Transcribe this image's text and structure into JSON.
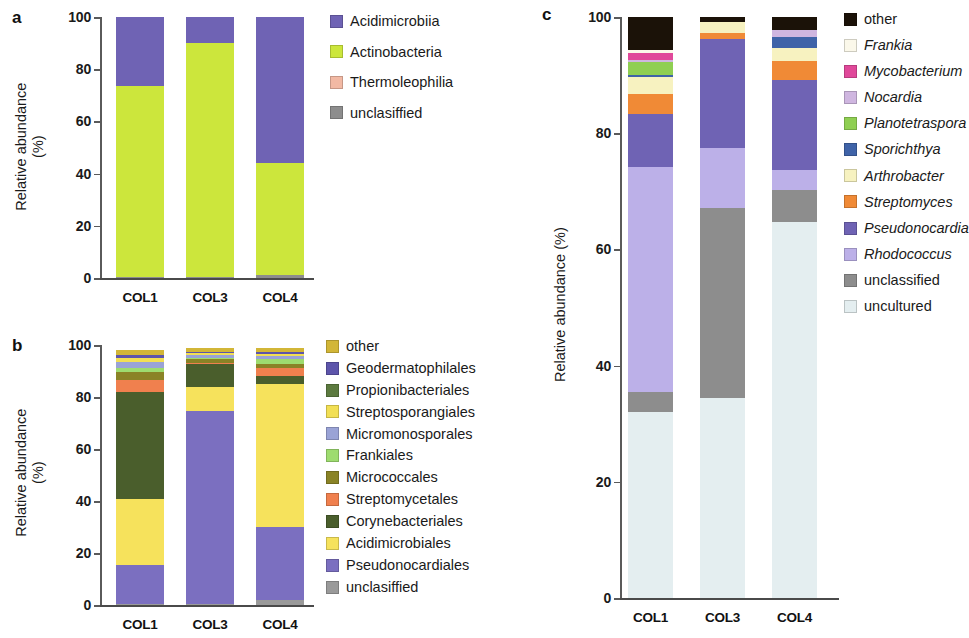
{
  "figure": {
    "panels": [
      "a",
      "b",
      "c"
    ],
    "y_axis_label": "Relative abundance",
    "y_axis_unit": "(%)",
    "y_axis_label_c": "Relative abundance (%)"
  },
  "panel_a": {
    "letter": "a",
    "ylabel_line1": "Relative abundance",
    "ylabel_line2": "(%)",
    "ticks": [
      "100",
      "80",
      "60",
      "40",
      "20",
      "0"
    ],
    "categories": [
      "COL1",
      "COL3",
      "COL4"
    ],
    "legend": [
      {
        "label": "Acidimicrobiia",
        "color": "#6f63b4"
      },
      {
        "label": "Actinobacteria",
        "color": "#cce63c"
      },
      {
        "label": "Thermoleophilia",
        "color": "#f2b9a4"
      },
      {
        "label": "unclasiffied",
        "color": "#8d8d8d"
      }
    ]
  },
  "panel_b": {
    "letter": "b",
    "ylabel_line1": "Relative abundance",
    "ylabel_line2": "(%)",
    "ticks": [
      "100",
      "80",
      "60",
      "40",
      "20",
      "0"
    ],
    "categories": [
      "COL1",
      "COL3",
      "COL4"
    ],
    "legend": [
      {
        "label": "other",
        "color": "#d2b637"
      },
      {
        "label": "Geodermatophilales",
        "color": "#5d55ab"
      },
      {
        "label": "Propionibacteriales",
        "color": "#5c7a3f"
      },
      {
        "label": "Streptosporangiales",
        "color": "#f2df54"
      },
      {
        "label": "Micromonosporales",
        "color": "#9aa3d6"
      },
      {
        "label": "Frankiales",
        "color": "#9ed croydon"
      },
      {
        "label": "Micrococcales",
        "color": "#8a8326"
      },
      {
        "label": "Streptomycetales",
        "color": "#f0804e"
      },
      {
        "label": "Corynebacteriales",
        "color": "#4a5e2c"
      },
      {
        "label": "Acidimicrobiales",
        "color": "#f6e25c"
      },
      {
        "label": "Pseudonocardiales",
        "color": "#7b6fc0"
      },
      {
        "label": "unclasiffied",
        "color": "#9a9a9a"
      }
    ]
  },
  "panel_c": {
    "letter": "c",
    "ylabel": "Relative abundance (%)",
    "ticks": [
      "100",
      "80",
      "60",
      "40",
      "20",
      "0"
    ],
    "categories": [
      "COL1",
      "COL3",
      "COL4"
    ],
    "legend": [
      {
        "label": "other",
        "color": "#1b1208",
        "italic": false
      },
      {
        "label": "Frankia",
        "color": "#fbf8ea",
        "italic": true
      },
      {
        "label": "Mycobacterium",
        "color": "#e0489a",
        "italic": true
      },
      {
        "label": "Nocardia",
        "color": "#cfb6e0",
        "italic": true
      },
      {
        "label": "Planotetraspora",
        "color": "#8fcf52",
        "italic": true
      },
      {
        "label": "Sporichthya",
        "color": "#3f63a8",
        "italic": true
      },
      {
        "label": "Arthrobacter",
        "color": "#f7f2c0",
        "italic": true
      },
      {
        "label": "Streptomyces",
        "color": "#f08a36",
        "italic": true
      },
      {
        "label": "Pseudonocardia",
        "color": "#6f63b4",
        "italic": true
      },
      {
        "label": "Rhodococcus",
        "color": "#bcb0e8",
        "italic": true
      },
      {
        "label": "unclassified",
        "color": "#8d8d8d",
        "italic": false
      },
      {
        "label": "uncultured",
        "color": "#e4eef0",
        "italic": false
      }
    ]
  },
  "chart_data": [
    {
      "type": "bar",
      "panel": "a",
      "stacked": true,
      "title": "",
      "xlabel": "",
      "ylabel": "Relative abundance (%)",
      "ylim": [
        0,
        100
      ],
      "yticks": [
        0,
        20,
        40,
        60,
        80,
        100
      ],
      "grid": false,
      "legend_position": "right",
      "categories": [
        "COL1",
        "COL3",
        "COL4"
      ],
      "series": [
        {
          "name": "unclasiffied",
          "color": "#8d8d8d",
          "values": [
            0.4,
            0.2,
            1.0
          ]
        },
        {
          "name": "Thermoleophilia",
          "color": "#f2b9a4",
          "values": [
            0.1,
            0.1,
            0.2
          ]
        },
        {
          "name": "Actinobacteria",
          "color": "#cce63c",
          "values": [
            73.0,
            89.7,
            42.8
          ]
        },
        {
          "name": "Acidimicrobiia",
          "color": "#6f63b4",
          "values": [
            26.5,
            10.0,
            56.0
          ]
        }
      ]
    },
    {
      "type": "bar",
      "panel": "b",
      "stacked": true,
      "title": "",
      "xlabel": "",
      "ylabel": "Relative abundance (%)",
      "ylim": [
        0,
        100
      ],
      "yticks": [
        0,
        20,
        40,
        60,
        80,
        100
      ],
      "grid": false,
      "legend_position": "right",
      "categories": [
        "COL1",
        "COL3",
        "COL4"
      ],
      "series": [
        {
          "name": "unclasiffied",
          "color": "#9a9a9a",
          "values": [
            0.5,
            0.3,
            1.8
          ]
        },
        {
          "name": "Pseudonocardiales",
          "color": "#7b6fc0",
          "values": [
            14.8,
            74.2,
            28.3
          ]
        },
        {
          "name": "Acidimicrobiales",
          "color": "#f6e25c",
          "values": [
            25.5,
            9.5,
            54.8
          ]
        },
        {
          "name": "Corynebacteriales",
          "color": "#4a5e2c",
          "values": [
            41.0,
            8.6,
            3.1
          ]
        },
        {
          "name": "Streptomycetales",
          "color": "#f0804e",
          "values": [
            4.9,
            0.6,
            3.0
          ]
        },
        {
          "name": "Micrococcales",
          "color": "#8a8326",
          "values": [
            3.1,
            1.3,
            1.6
          ]
        },
        {
          "name": "Frankiales",
          "color": "#9edc6f",
          "values": [
            1.2,
            0.6,
            2.1
          ]
        },
        {
          "name": "Micromonosporales",
          "color": "#9aa3d6",
          "values": [
            2.3,
            1.1,
            1.2
          ]
        },
        {
          "name": "Streptosporangiales",
          "color": "#f2df54",
          "values": [
            1.9,
            0.7,
            0.8
          ]
        },
        {
          "name": "Geodermatophilales",
          "color": "#5d55ab",
          "values": [
            0.9,
            0.5,
            0.7
          ]
        },
        {
          "name": "other",
          "color": "#d2b637",
          "values": [
            1.9,
            1.6,
            1.6
          ]
        }
      ]
    },
    {
      "type": "bar",
      "panel": "c",
      "stacked": true,
      "title": "",
      "xlabel": "",
      "ylabel": "Relative abundance (%)",
      "ylim": [
        0,
        100
      ],
      "yticks": [
        0,
        20,
        40,
        60,
        80,
        100
      ],
      "grid": false,
      "legend_position": "right",
      "categories": [
        "COL1",
        "COL3",
        "COL4"
      ],
      "series": [
        {
          "name": "uncultured",
          "color": "#e4eef0",
          "values": [
            32.0,
            34.4,
            64.7
          ]
        },
        {
          "name": "unclassified",
          "color": "#8d8d8d",
          "values": [
            3.5,
            32.7,
            5.5
          ]
        },
        {
          "name": "Rhodococcus",
          "color": "#bcb0e8",
          "values": [
            38.7,
            10.3,
            3.4
          ]
        },
        {
          "name": "Pseudonocardia",
          "color": "#6f63b4",
          "values": [
            9.1,
            18.9,
            15.5
          ]
        },
        {
          "name": "Streptomyces",
          "color": "#f08a36",
          "values": [
            3.4,
            0.9,
            3.4
          ]
        },
        {
          "name": "Arthrobacter",
          "color": "#f7f2c0",
          "values": [
            2.9,
            1.9,
            2.1
          ]
        },
        {
          "name": "Sporichthya",
          "color": "#3f63a8",
          "values": [
            0.5,
            0.0,
            1.9
          ]
        },
        {
          "name": "Planotetraspora",
          "color": "#8fcf52",
          "values": [
            2.1,
            0.0,
            0.0
          ]
        },
        {
          "name": "Nocardia",
          "color": "#cfb6e0",
          "values": [
            0.5,
            0.0,
            1.2
          ]
        },
        {
          "name": "Mycobacterium",
          "color": "#e0489a",
          "values": [
            1.2,
            0.0,
            0.1
          ]
        },
        {
          "name": "Frankia",
          "color": "#fbf8ea",
          "values": [
            0.5,
            0.0,
            0.0
          ]
        },
        {
          "name": "other",
          "color": "#1b1208",
          "values": [
            5.6,
            0.9,
            2.2
          ]
        }
      ]
    }
  ]
}
